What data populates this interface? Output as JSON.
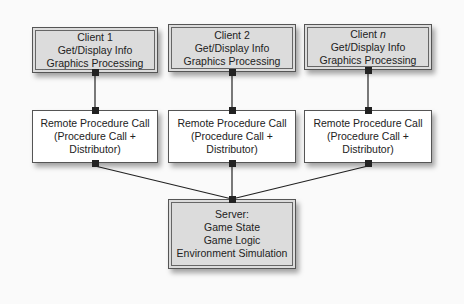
{
  "clients": [
    {
      "title": "Client 1",
      "line2": "Get/Display Info",
      "line3": "Graphics Processing"
    },
    {
      "title": "Client 2",
      "line2": "Get/Display Info",
      "line3": "Graphics Processing"
    },
    {
      "title_prefix": "Client ",
      "title_italic": "n",
      "line2": "Get/Display Info",
      "line3": "Graphics Processing"
    }
  ],
  "rpc": [
    {
      "line1": "Remote Procedure Call",
      "line2": "(Procedure Call +",
      "line3": "Distributor)"
    },
    {
      "line1": "Remote Procedure Call",
      "line2": "(Procedure Call +",
      "line3": "Distributor)"
    },
    {
      "line1": "Remote Procedure Call",
      "line2": "(Procedure Call +",
      "line3": "Distributor)"
    }
  ],
  "server": {
    "line1": "Server:",
    "line2": "Game State",
    "line3": "Game Logic",
    "line4": "Environment Simulation"
  }
}
